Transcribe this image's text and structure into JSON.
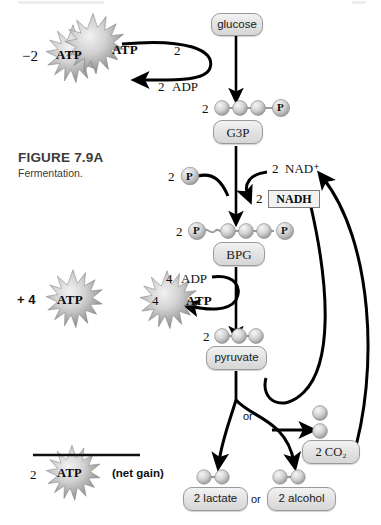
{
  "figure": {
    "title": "FIGURE 7.9A",
    "subtitle": "Fermentation.",
    "topic": "glycolysis-fermentation-pathway"
  },
  "colors": {
    "chip_fill": "#e4e4e4",
    "chip_border": "#9a9a9a",
    "circle_fill": "#cfcfcf",
    "arrow": "#000000",
    "caption": "#3b3b3b",
    "nadh_box": "#f2f2f2"
  },
  "ledger": {
    "invested": {
      "count": "−2",
      "molecule": "ATP"
    },
    "produced": {
      "count": "+ 4",
      "molecule": "ATP"
    },
    "net": {
      "count": "2",
      "molecule": "ATP",
      "note": "(net gain)"
    }
  },
  "pathway": {
    "nodes": [
      {
        "id": "glucose",
        "label": "glucose",
        "carbons": 0,
        "prefix": ""
      },
      {
        "id": "g3p",
        "label": "G3P",
        "carbons": 3,
        "prefix": "2"
      },
      {
        "id": "bpg",
        "label": "BPG",
        "carbons": 3,
        "prefix": "2"
      },
      {
        "id": "pyruvate",
        "label": "pyruvate",
        "carbons": 3,
        "prefix": "2"
      },
      {
        "id": "lactate",
        "label": "2 lactate",
        "carbons": 2,
        "prefix": ""
      },
      {
        "id": "alcohol",
        "label": "2 alcohol",
        "carbons": 2,
        "prefix": ""
      },
      {
        "id": "co2",
        "label": "2 CO₂",
        "carbons": 0,
        "prefix": ""
      }
    ],
    "reactants": [
      {
        "id": "atp-in",
        "count": "2",
        "label": "ATP"
      },
      {
        "id": "adp-out",
        "count": "2",
        "label": "ADP"
      },
      {
        "id": "phosphate",
        "count": "2",
        "label": "P"
      },
      {
        "id": "nad-plus",
        "count": "2",
        "label": "NAD⁺"
      },
      {
        "id": "nadh",
        "count": "2",
        "label": "NADH"
      },
      {
        "id": "adp-in",
        "count": "4",
        "label": "ADP"
      },
      {
        "id": "atp-out",
        "count": "4",
        "label": "ATP"
      }
    ],
    "branch_label": "or",
    "product_separator": "or",
    "bpg_phosphates": {
      "left": "P",
      "right": "P"
    },
    "g3p_phosphate": "P"
  },
  "icons": {
    "atp_burst": "starburst-icon",
    "carbon_circle": "carbon-sphere-icon",
    "phosphate_circle": "phosphate-sphere-icon",
    "arrow": "arrow-icon",
    "curved_arrow": "curved-arrow-icon",
    "recycle_arrow": "recycling-arrow-icon"
  }
}
